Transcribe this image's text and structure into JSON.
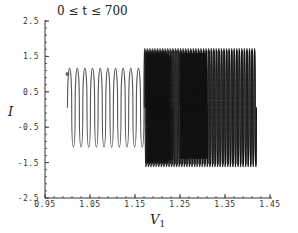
{
  "chart_data": {
    "type": "line",
    "title": "0 ≤ t ≤ 700",
    "xlabel": "V1",
    "xlabel_main": "V",
    "xlabel_sub": "1",
    "ylabel": "I",
    "xlim": [
      0.95,
      1.45
    ],
    "ylim": [
      -2.5,
      2.5
    ],
    "xticks": [
      0.95,
      1.05,
      1.15,
      1.25,
      1.35,
      1.45
    ],
    "xtick_labels": [
      "0.95",
      "1.05",
      "1.15",
      "1.25",
      "1.35",
      "1.45"
    ],
    "yticks": [
      2.5,
      1.5,
      0.5,
      -0.5,
      -1.5,
      -2.5
    ],
    "ytick_labels": [
      "2.5",
      "1.5",
      "0.5",
      "-0.5",
      "-1.5",
      "-2.5"
    ],
    "grid": false,
    "legend": null,
    "start_point": {
      "x": 1.0,
      "y": 1.0
    },
    "segments": [
      {
        "name": "transient oscillations",
        "x_start": 1.0,
        "x_end": 1.17,
        "loops": 10,
        "peak": 1.45,
        "trough": -1.35
      },
      {
        "name": "dense attractor band",
        "x_start": 1.17,
        "x_end": 1.42,
        "loops": 44,
        "peak": 2.2,
        "trough": -2.1
      },
      {
        "name": "dense inner block",
        "x_start": 1.25,
        "x_end": 1.31,
        "loops": 30,
        "peak": 2.0,
        "trough": -1.8
      }
    ],
    "line_color": "#555555",
    "dense_color": "#111111"
  }
}
